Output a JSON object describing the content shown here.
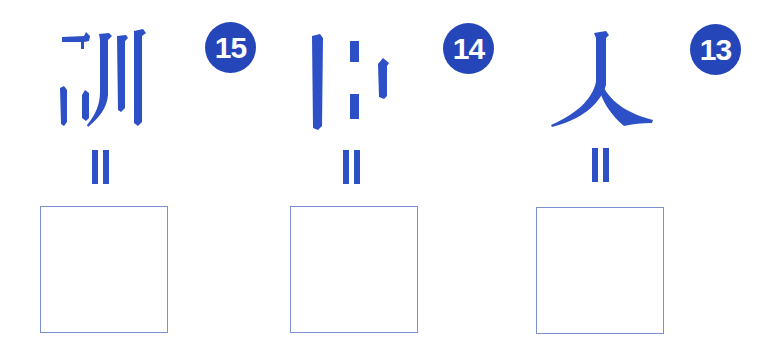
{
  "colors": {
    "glyph_blue": "#2d50c6",
    "badge_blue": "#2546b8",
    "badge_text": "#ffffff",
    "box_border": "#7c8fd2",
    "background": "#ffffff"
  },
  "items": [
    {
      "number": "15",
      "glyph_description": "partial character 訓 (strokes of 言 radical fragments and 川)",
      "equals_symbol": "vertical double bar",
      "answer": ""
    },
    {
      "number": "14",
      "glyph_description": "fragmented vertical strokes (partial character)",
      "equals_symbol": "vertical double bar",
      "answer": ""
    },
    {
      "number": "13",
      "glyph_description": "character 人",
      "equals_symbol": "vertical double bar",
      "answer": ""
    }
  ]
}
